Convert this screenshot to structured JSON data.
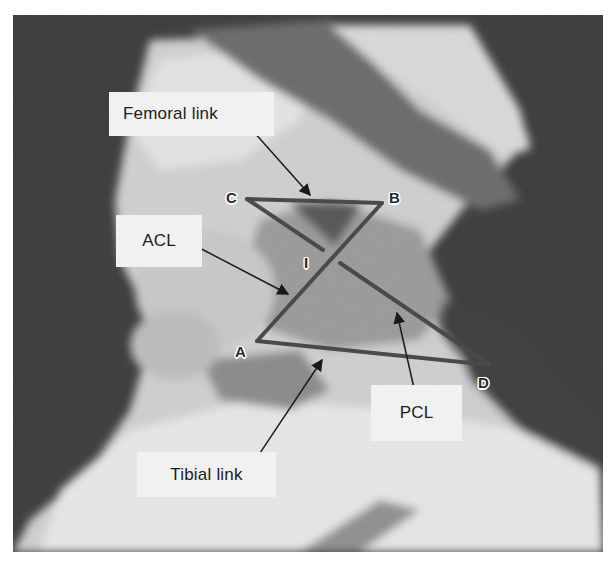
{
  "figure": {
    "labels": {
      "femoral_link": "Femoral link",
      "acl": "ACL",
      "tibial_link": "Tibial link",
      "pcl": "PCL"
    },
    "points": {
      "A": "A",
      "B": "B",
      "C": "C",
      "D": "D",
      "I": "I"
    },
    "colors": {
      "background_dark": "#3a3a3a",
      "label_box": "#f1f1f1",
      "link_line": "#4a4a4a",
      "arrow": "#1a1a1a"
    }
  }
}
